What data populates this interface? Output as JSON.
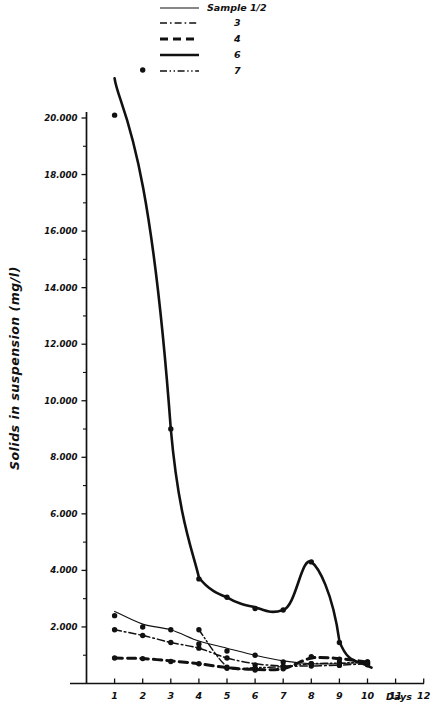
{
  "chart_data": {
    "type": "line",
    "title": "",
    "xlabel": "Days",
    "ylabel": "Solids in suspension (mg/l)",
    "xlim": [
      0,
      12.6
    ],
    "ylim": [
      0,
      21000
    ],
    "grid": false,
    "legend_position": "top-center",
    "x_tick_labels": [
      "1",
      "2",
      "3",
      "4",
      "5",
      "6",
      "7",
      "8",
      "9",
      "10",
      "11",
      "12"
    ],
    "x_tick_values": [
      1,
      2,
      3,
      4,
      5,
      6,
      7,
      8,
      9,
      10,
      11,
      12
    ],
    "y_tick_labels": [
      "2.000",
      "4.000",
      "6.000",
      "8.000",
      "10.000",
      "12.000",
      "14.000",
      "16.000",
      "18.000",
      "20.000"
    ],
    "y_tick_values": [
      2000,
      4000,
      6000,
      8000,
      10000,
      12000,
      14000,
      16000,
      18000,
      20000
    ],
    "y_minor_tick_values": [
      1000,
      3000,
      5000,
      7000,
      9000,
      11000,
      13000,
      15000,
      17000,
      19000
    ],
    "legend_title": "Sample",
    "series": [
      {
        "name": "1/2",
        "legend_label": "Sample  1/2",
        "line_style": "thin-solid",
        "x": [
          1,
          2,
          3,
          4,
          5,
          6,
          7,
          8,
          9,
          10
        ],
        "values": [
          2550,
          2100,
          1900,
          1500,
          1250,
          1000,
          800,
          700,
          700,
          750
        ],
        "points_x": [
          1,
          2,
          3,
          4,
          5,
          6,
          7,
          8,
          9,
          10
        ],
        "points_y": [
          2400,
          2000,
          1900,
          1400,
          1150,
          1000,
          760,
          700,
          740,
          720
        ]
      },
      {
        "name": "3",
        "legend_label": "3",
        "line_style": "dash-dot",
        "x": [
          1,
          2,
          3,
          4,
          5,
          6,
          7,
          8,
          9,
          10
        ],
        "values": [
          1900,
          1700,
          1450,
          1250,
          900,
          700,
          620,
          620,
          650,
          700
        ],
        "points_x": [
          1,
          2,
          3,
          4,
          5,
          6,
          7,
          8,
          9,
          10
        ],
        "points_y": [
          1900,
          1700,
          1450,
          1250,
          900,
          660,
          600,
          620,
          640,
          700
        ]
      },
      {
        "name": "4",
        "legend_label": "4",
        "line_style": "dashed-bold",
        "x": [
          1,
          2,
          3,
          4,
          5,
          6,
          7,
          8,
          9,
          10
        ],
        "values": [
          900,
          880,
          800,
          700,
          560,
          500,
          520,
          900,
          880,
          760
        ],
        "points_x": [
          1,
          2,
          3,
          4,
          5,
          6,
          7,
          8,
          9,
          10
        ],
        "points_y": [
          900,
          880,
          780,
          700,
          540,
          480,
          520,
          950,
          860,
          760
        ]
      },
      {
        "name": "6",
        "legend_label": "6",
        "line_style": "thick-solid",
        "x": [
          1,
          2,
          3,
          4,
          5,
          6,
          7,
          8,
          9,
          10
        ],
        "values": [
          21400,
          21700,
          9000,
          3750,
          3050,
          2700,
          2600,
          4300,
          1500,
          700
        ],
        "points_x": [
          1,
          2,
          3,
          4,
          5,
          6,
          7,
          8,
          9,
          10
        ],
        "points_y": [
          20100,
          21700,
          9000,
          3700,
          3050,
          2650,
          2600,
          4300,
          1450,
          660
        ]
      },
      {
        "name": "7",
        "legend_label": "7",
        "line_style": "dash-dot-dot",
        "x": [
          4,
          5,
          6,
          7,
          8,
          9,
          10
        ],
        "values": [
          1900,
          600,
          560,
          600,
          700,
          720,
          760
        ],
        "points_x": [
          4,
          5,
          6,
          7,
          8,
          9,
          10
        ],
        "points_y": [
          1900,
          580,
          540,
          600,
          700,
          700,
          760
        ]
      }
    ],
    "legend_entries": [
      {
        "label": "Sample  1/2",
        "style": "thin-solid"
      },
      {
        "label": "3",
        "style": "dash-dot"
      },
      {
        "label": "4",
        "style": "dashed-bold"
      },
      {
        "label": "6",
        "style": "thick-solid"
      },
      {
        "label": "7",
        "style": "dash-dot-dot"
      }
    ]
  },
  "colors": {
    "ink": "#111111",
    "background": "#ffffff"
  }
}
